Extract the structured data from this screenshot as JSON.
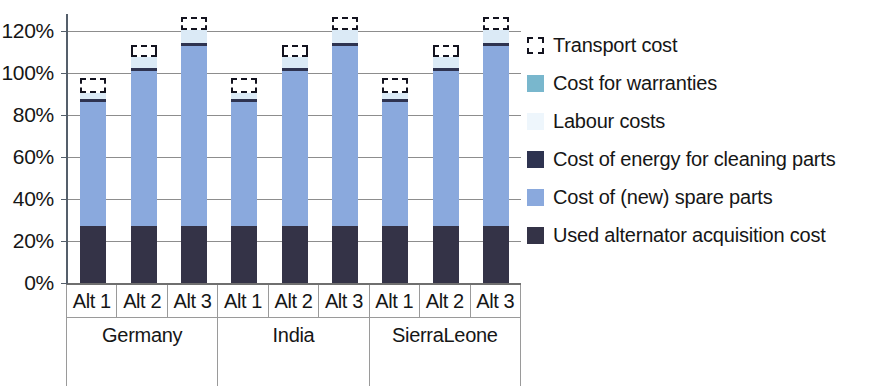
{
  "chart_data": {
    "type": "bar",
    "subtype": "stacked-column-percentage",
    "title": "",
    "xlabel": "",
    "ylabel": "",
    "ylim": [
      0,
      130
    ],
    "y_ticks": [
      "0%",
      "20%",
      "40%",
      "60%",
      "80%",
      "100%",
      "120%"
    ],
    "y_tick_values": [
      0,
      20,
      40,
      60,
      80,
      100,
      120
    ],
    "grid": true,
    "legend_position": "right",
    "groups": [
      {
        "name": "Germany",
        "categories": [
          "Alt 1",
          "Alt 2",
          "Alt 3"
        ]
      },
      {
        "name": "India",
        "categories": [
          "Alt 1",
          "Alt 2",
          "Alt 3"
        ]
      },
      {
        "name": "Sierra Leone",
        "categories": [
          "Alt 1",
          "Alt 2",
          "Alt 3"
        ]
      }
    ],
    "categories": [
      "Alt 1",
      "Alt 2",
      "Alt 3",
      "Alt 1",
      "Alt 2",
      "Alt 3",
      "Alt 1",
      "Alt 2",
      "Alt 3"
    ],
    "series": [
      {
        "name": "Used alternator acquisition  cost",
        "color": "#343347",
        "values": [
          27,
          27,
          27,
          27,
          27,
          27,
          27,
          27,
          27
        ]
      },
      {
        "name": "Cost of (new) spare parts",
        "color": "#8aa9dd",
        "values": [
          59,
          74,
          86,
          59,
          74,
          86,
          59,
          74,
          86
        ]
      },
      {
        "name": "Cost of energy for cleaning parts",
        "color": "#2e3350",
        "values": [
          1.5,
          1.5,
          1.5,
          1.5,
          1.5,
          1.5,
          1.5,
          1.5,
          1.5
        ]
      },
      {
        "name": "Labour costs",
        "color": "#dbeaf6",
        "values": [
          3,
          5,
          6,
          3,
          5,
          6,
          3,
          5,
          6
        ]
      },
      {
        "name": "Cost for warranties",
        "color": "#79b7cd",
        "values": [
          0,
          0,
          0,
          0,
          0,
          0,
          0,
          0,
          0
        ]
      },
      {
        "name": "Transport cost",
        "color": "#ffffff",
        "outline": "dashed",
        "values": [
          7,
          6,
          6,
          7,
          6,
          6,
          7,
          6,
          6
        ]
      }
    ],
    "bar_totals": [
      97.5,
      113.5,
      126.5,
      97.5,
      113.5,
      126.5,
      97.5,
      113.5,
      126.5
    ]
  },
  "axis": {
    "y_ticks": [
      {
        "label": "120%",
        "value": 120
      },
      {
        "label": "100%",
        "value": 100
      },
      {
        "label": "80%",
        "value": 80
      },
      {
        "label": "60%",
        "value": 60
      },
      {
        "label": "40%",
        "value": 40
      },
      {
        "label": "20%",
        "value": 20
      },
      {
        "label": "0%",
        "value": 0
      }
    ]
  },
  "category_axis": {
    "alt_labels": [
      "Alt 1",
      "Alt 2",
      "Alt 3",
      "Alt 1",
      "Alt 2",
      "Alt 3",
      "Alt 1",
      "Alt 2",
      "Alt 3"
    ],
    "country_labels": [
      {
        "line1": "Germany",
        "line2": ""
      },
      {
        "line1": "India",
        "line2": ""
      },
      {
        "line1": "Sierra",
        "line2": "Leone"
      }
    ]
  },
  "legend": {
    "items": [
      {
        "label": "Transport cost",
        "swatch": "transport-swatch-icon",
        "color": "#ffffff"
      },
      {
        "label": "Cost for warranties",
        "swatch": "warranty-swatch-icon",
        "color": "#79b7cd"
      },
      {
        "label": "Labour costs",
        "swatch": "labour-swatch-icon",
        "color": "#eef6fc"
      },
      {
        "label": "Cost of energy for cleaning parts",
        "swatch": "energy-swatch-icon",
        "color": "#2e3350"
      },
      {
        "label": "Cost of (new) spare parts",
        "swatch": "spare-parts-swatch-icon",
        "color": "#8aa9dd"
      },
      {
        "label": "Used alternator acquisition  cost",
        "swatch": "used-alternator-swatch-icon",
        "color": "#343347"
      }
    ]
  }
}
